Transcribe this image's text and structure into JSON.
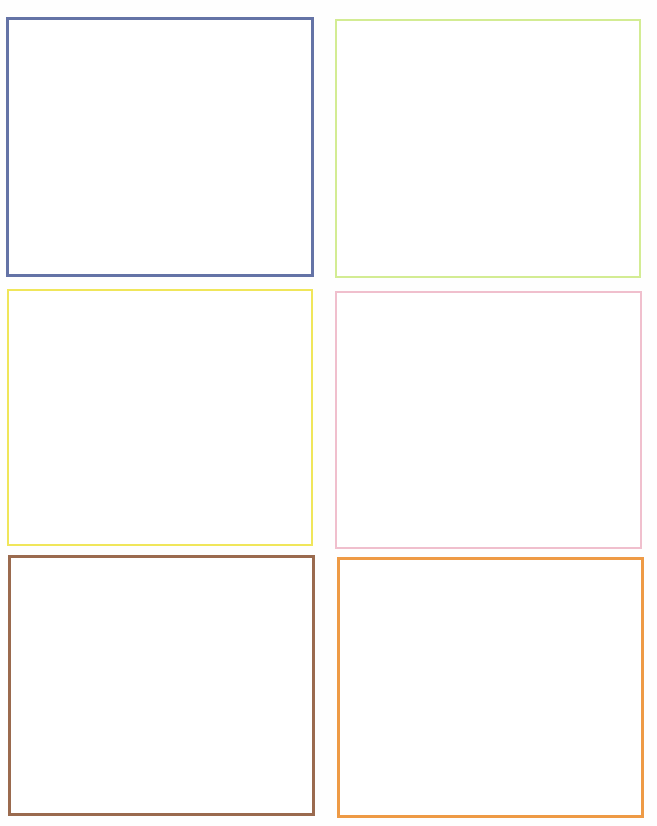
{
  "page": {
    "background": "#ffffff",
    "layout": "3 rows x 2 columns of empty rectangular frames"
  },
  "frames": [
    {
      "position": "top-left",
      "border_color": "#6473a6",
      "color_name": "slate blue",
      "content": ""
    },
    {
      "position": "top-right",
      "border_color": "#d3ec93",
      "color_name": "light yellow-green",
      "content": ""
    },
    {
      "position": "middle-left",
      "border_color": "#f0e65a",
      "color_name": "yellow",
      "content": ""
    },
    {
      "position": "middle-right",
      "border_color": "#f0bfcd",
      "color_name": "light pink",
      "content": ""
    },
    {
      "position": "bottom-left",
      "border_color": "#9a6a4e",
      "color_name": "brown",
      "content": ""
    },
    {
      "position": "bottom-right",
      "border_color": "#ee9a45",
      "color_name": "orange",
      "content": ""
    }
  ]
}
